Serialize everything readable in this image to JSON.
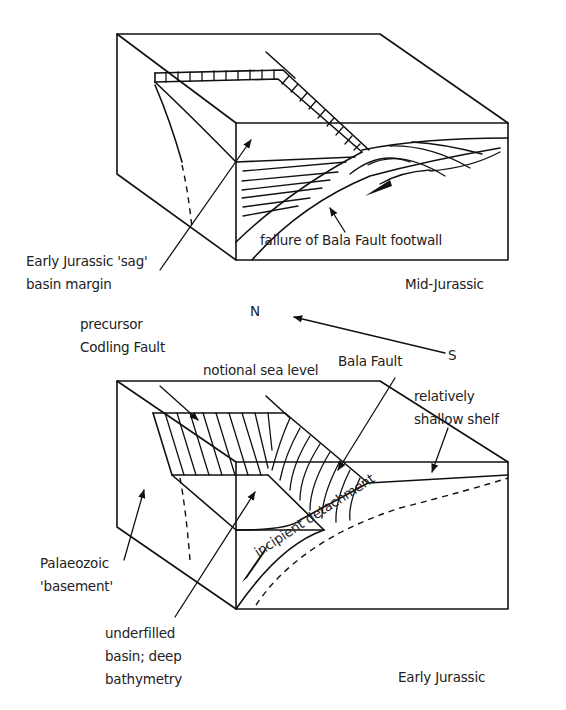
{
  "figure": {
    "type": "geological block diagram",
    "panels": [
      {
        "id": "top",
        "period_label": "Mid-Jurassic",
        "annotations": {
          "sag_margin_line1": "Early Jurassic 'sag'",
          "sag_margin_line2": "basin margin",
          "footwall_failure": "failure of Bala Fault footwall"
        }
      },
      {
        "id": "bottom",
        "period_label": "Early Jurassic",
        "annotations": {
          "codling_line1": "precursor",
          "codling_line2": "Codling Fault",
          "sea_level": "notional sea level",
          "bala_fault": "Bala Fault",
          "shelf_line1": "relatively",
          "shelf_line2": "shallow shelf",
          "basement_line1": "Palaeozoic",
          "basement_line2": "'basement'",
          "basin_line1": "underfilled",
          "basin_line2": "basin; deep",
          "basin_line3": "bathymetry",
          "detachment": "incipient detachment"
        }
      }
    ],
    "compass": {
      "north": "N",
      "south": "S"
    },
    "colors": {
      "ink": "#111111",
      "background": "#ffffff"
    }
  }
}
